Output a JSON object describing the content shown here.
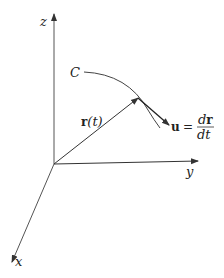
{
  "diagram": {
    "axes": {
      "z_label": "z",
      "y_label": "y",
      "x_label": "x"
    },
    "curve_label": "C",
    "position_vector": {
      "bold": "r",
      "arg": "(t)"
    },
    "tangent_vector": {
      "bold": "u",
      "equals": "=",
      "numerator_d": "d",
      "numerator_bold": "r",
      "denominator": "dt"
    },
    "colors": {
      "stroke": "#333333",
      "background": "#ffffff"
    }
  }
}
